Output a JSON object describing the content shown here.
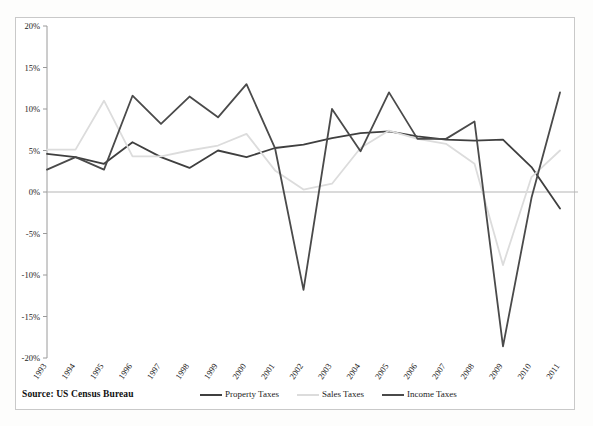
{
  "chart_data": {
    "type": "line",
    "title": "",
    "subtitle": "",
    "xlabel": "",
    "ylabel": "",
    "categories": [
      "1993",
      "1994",
      "1995",
      "1996",
      "1997",
      "1998",
      "1999",
      "2000",
      "2001",
      "2002",
      "2003",
      "2004",
      "2005",
      "2006",
      "2007",
      "2008",
      "2009",
      "2010",
      "2011"
    ],
    "ylim": [
      -20,
      20
    ],
    "ytick_values": [
      20,
      15,
      10,
      5,
      0,
      -5,
      -10,
      -15,
      -20
    ],
    "ytick_labels": [
      "20%",
      "15%",
      "10%",
      "5%",
      "0%",
      "-5%",
      "-10%",
      "-15%",
      "-20%"
    ],
    "grid": false,
    "legend_position": "bottom",
    "series": [
      {
        "name": "Property Taxes",
        "color": "#3f3f3f",
        "values": [
          4.6,
          4.2,
          3.4,
          6.0,
          4.2,
          2.9,
          5.0,
          4.2,
          5.3,
          5.7,
          6.5,
          7.1,
          7.3,
          6.7,
          6.3,
          6.2,
          6.3,
          3.0,
          -2.0
        ]
      },
      {
        "name": "Sales Taxes",
        "color": "#dcdcdc",
        "values": [
          5.1,
          5.1,
          11.0,
          4.3,
          4.3,
          5.0,
          5.6,
          7.0,
          2.6,
          0.3,
          1.0,
          5.3,
          7.4,
          6.4,
          5.8,
          3.4,
          -8.8,
          1.8,
          5.0
        ]
      },
      {
        "name": "Income Taxes",
        "color": "#4a4a4a",
        "values": [
          2.7,
          4.2,
          2.7,
          11.6,
          8.2,
          11.5,
          9.0,
          13.0,
          5.3,
          -11.8,
          10.0,
          4.9,
          12.0,
          6.4,
          6.4,
          8.5,
          -18.6,
          -0.7,
          12.0
        ]
      }
    ],
    "source_note": "Source: US Census Bureau"
  },
  "legend": {
    "items": [
      {
        "label": "Property Taxes",
        "color": "#3f3f3f"
      },
      {
        "label": "Sales Taxes",
        "color": "#dcdcdc"
      },
      {
        "label": "Income Taxes",
        "color": "#4a4a4a"
      }
    ]
  },
  "footer": {
    "source": "Source: US Census Bureau"
  }
}
